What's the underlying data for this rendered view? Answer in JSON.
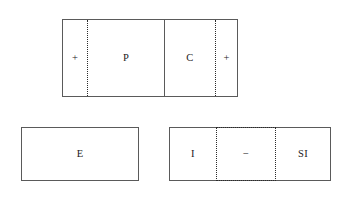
{
  "diagram": {
    "title": "",
    "background_color": "#ffffff",
    "stroke_color": "#5a5a5a",
    "dotted_color": "#2b2b2b",
    "text_color": "#1a1a1a",
    "boxes": [
      {
        "id": "box-pc",
        "name": "top-rectangle",
        "cells": [
          {
            "label": "+",
            "divider_right": "dotted"
          },
          {
            "label": "P",
            "divider_right": "solid"
          },
          {
            "label": "C",
            "divider_right": "dotted"
          },
          {
            "label": "+",
            "divider_right": "none"
          }
        ]
      },
      {
        "id": "box-e",
        "name": "bottom-left-rectangle",
        "cells": [
          {
            "label": "E",
            "divider_right": "none"
          }
        ]
      },
      {
        "id": "box-isi",
        "name": "bottom-right-rectangle",
        "cells": [
          {
            "label": "I",
            "divider_right": "dotted"
          },
          {
            "label": "−",
            "divider_right": "dotted"
          },
          {
            "label": "SI",
            "divider_right": "none"
          }
        ]
      }
    ]
  }
}
